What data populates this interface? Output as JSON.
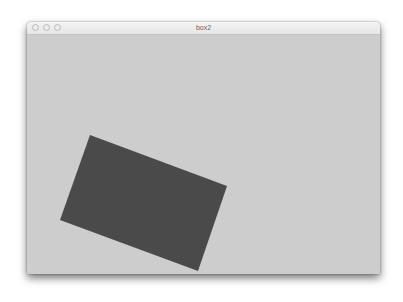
{
  "window": {
    "title": "box2",
    "controls": [
      "close",
      "minimize",
      "zoom"
    ]
  },
  "canvas": {
    "background": "#cdcdcd",
    "shape": {
      "type": "rotated-rectangle",
      "fill": "#4a4a4a",
      "points": "63,100 200,151 171,236 33,185"
    }
  }
}
